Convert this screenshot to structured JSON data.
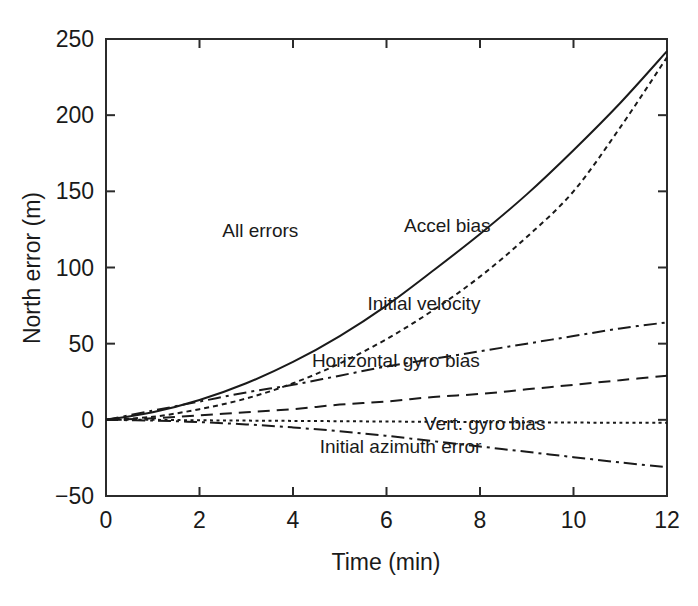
{
  "chart_data": {
    "type": "line",
    "title": "",
    "xlabel": "Time (min)",
    "ylabel": "North error (m)",
    "xlim": [
      0,
      12
    ],
    "ylim": [
      -50,
      250
    ],
    "xticks": [
      0,
      2,
      4,
      6,
      8,
      10,
      12
    ],
    "yticks": [
      -50,
      0,
      50,
      100,
      150,
      200,
      250
    ],
    "xtick_labels": [
      "0",
      "2",
      "4",
      "6",
      "8",
      "10",
      "12"
    ],
    "ytick_labels": [
      "-50",
      "0",
      "50",
      "100",
      "150",
      "200",
      "250"
    ],
    "grid": false,
    "legend_position": "inline-annotations",
    "x": [
      0,
      1,
      2,
      3,
      4,
      5,
      6,
      7,
      8,
      9,
      10,
      11,
      12
    ],
    "series": [
      {
        "name": "All errors",
        "style": "solid",
        "label_x": 3.3,
        "label_y": 120,
        "values": [
          0,
          5,
          13,
          24,
          38,
          55,
          75,
          98,
          122,
          148,
          177,
          208,
          242
        ]
      },
      {
        "name": "Accel bias",
        "style": "dotted",
        "label_x": 7.3,
        "label_y": 123,
        "values": [
          0,
          2,
          7,
          14,
          24,
          37,
          53,
          72,
          94,
          120,
          150,
          192,
          238
        ]
      },
      {
        "name": "Initial velocity",
        "style": "dash-dot",
        "label_x": 6.8,
        "label_y": 72,
        "values": [
          0,
          6,
          12,
          18,
          23,
          29,
          35,
          40,
          45,
          50,
          55,
          60,
          64
        ]
      },
      {
        "name": "Horizontal gyro bias",
        "style": "dashed",
        "label_x": 6.2,
        "label_y": 35,
        "values": [
          0,
          1,
          3,
          5,
          7,
          10,
          12,
          15,
          17,
          20,
          23,
          26,
          29
        ]
      },
      {
        "name": "Vert. gyro bias",
        "style": "fine-dotted",
        "label_x": 8.1,
        "label_y": -7,
        "values": [
          0,
          0,
          -0.3,
          -0.5,
          -0.7,
          -0.9,
          -1.1,
          -1.3,
          -1.5,
          -1.7,
          -1.8,
          -1.9,
          -2
        ]
      },
      {
        "name": "Initial azimuth error",
        "style": "dash-dot",
        "label_x": 6.3,
        "label_y": -22,
        "values": [
          0,
          -0.5,
          -1.5,
          -3,
          -5,
          -7.5,
          -10.5,
          -14,
          -17.5,
          -21,
          -24.5,
          -28,
          -31
        ]
      }
    ]
  },
  "caption": {
    "text": ""
  }
}
